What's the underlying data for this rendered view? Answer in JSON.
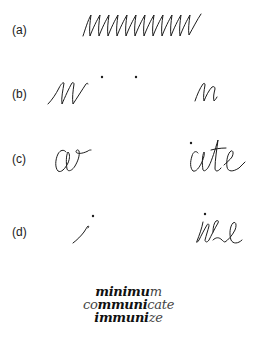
{
  "figure": {
    "rows": [
      {
        "label": "(a)",
        "description": "continuous zigzag scribble of minim strokes"
      },
      {
        "label": "(b)",
        "description": "partial scribble with two dots, then short scribble"
      },
      {
        "label": "(c)",
        "left_text": "co",
        "right_text": "cate"
      },
      {
        "label": "(d)",
        "left_text": "i",
        "right_text": "ize"
      }
    ],
    "words": [
      {
        "parts": [
          {
            "text": "minimu",
            "weight": "bold"
          },
          {
            "text": "m",
            "weight": "light"
          }
        ]
      },
      {
        "parts": [
          {
            "text": "co",
            "weight": "light"
          },
          {
            "text": "mmuni",
            "weight": "bold"
          },
          {
            "text": "cate",
            "weight": "light"
          }
        ]
      },
      {
        "parts": [
          {
            "text": "immuni",
            "weight": "bold"
          },
          {
            "text": "ze",
            "weight": "light"
          }
        ]
      }
    ],
    "colors": {
      "ink": "#1c1c1c",
      "background": "#ffffff"
    }
  }
}
